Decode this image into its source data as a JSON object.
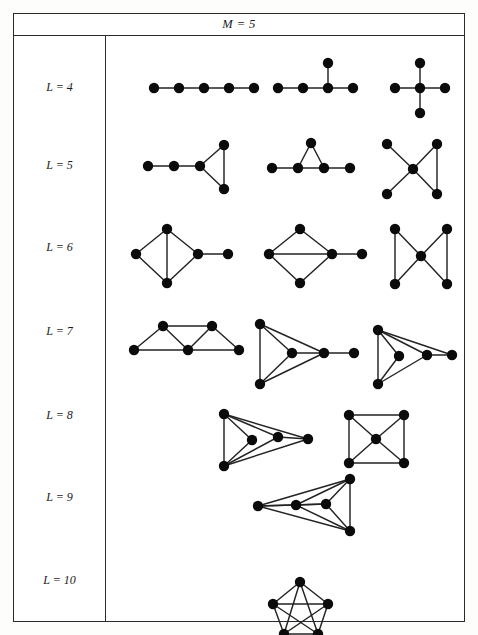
{
  "figure": {
    "header": {
      "title": "M = 5"
    },
    "colors": {
      "border": "#2b2b2b",
      "node": "#0b0b0b",
      "edge": "#232323",
      "background": "#ffffff"
    },
    "rows": [
      {
        "label": "L = 4",
        "edge_count": 4,
        "label_y": 52
      },
      {
        "label": "L = 5",
        "edge_count": 5,
        "label_y": 130
      },
      {
        "label": "L = 6",
        "edge_count": 6,
        "label_y": 212
      },
      {
        "label": "L = 7",
        "edge_count": 7,
        "label_y": 296
      },
      {
        "label": "L = 8",
        "edge_count": 8,
        "label_y": 380
      },
      {
        "label": "L = 9",
        "edge_count": 9,
        "label_y": 462
      },
      {
        "label": "L = 10",
        "edge_count": 10,
        "label_y": 545
      }
    ]
  },
  "chart_data": {
    "type": "diagram",
    "title": "M = 5",
    "node_count": 5,
    "node_radius": 5.2,
    "rows": [
      {
        "label": "L = 4",
        "edge_count": 4,
        "graphs": [
          {
            "name": "path-p5",
            "nodes": [
              [
                48,
                52
              ],
              [
                73,
                52
              ],
              [
                98,
                52
              ],
              [
                123,
                52
              ],
              [
                148,
                52
              ]
            ],
            "edges": [
              [
                0,
                1
              ],
              [
                1,
                2
              ],
              [
                2,
                3
              ],
              [
                3,
                4
              ]
            ]
          },
          {
            "name": "t-shape-tree",
            "nodes": [
              [
                172,
                52
              ],
              [
                197,
                52
              ],
              [
                222,
                52
              ],
              [
                247,
                52
              ],
              [
                222,
                27
              ]
            ],
            "edges": [
              [
                0,
                1
              ],
              [
                1,
                2
              ],
              [
                2,
                3
              ],
              [
                2,
                4
              ]
            ]
          },
          {
            "name": "star-k14",
            "nodes": [
              [
                289,
                52
              ],
              [
                314,
                52
              ],
              [
                339,
                52
              ],
              [
                314,
                27
              ],
              [
                314,
                77
              ]
            ],
            "edges": [
              [
                0,
                1
              ],
              [
                1,
                2
              ],
              [
                1,
                3
              ],
              [
                1,
                4
              ]
            ]
          }
        ]
      },
      {
        "label": "L = 5",
        "edge_count": 5,
        "graphs": [
          {
            "name": "triangle-with-two-tail",
            "nodes": [
              [
                42,
                130
              ],
              [
                68,
                130
              ],
              [
                94,
                130
              ],
              [
                118,
                109
              ],
              [
                118,
                153
              ]
            ],
            "edges": [
              [
                0,
                1
              ],
              [
                1,
                2
              ],
              [
                2,
                3
              ],
              [
                2,
                4
              ],
              [
                3,
                4
              ]
            ]
          },
          {
            "name": "triangle-on-path",
            "nodes": [
              [
                166,
                132
              ],
              [
                192,
                132
              ],
              [
                218,
                132
              ],
              [
                244,
                132
              ],
              [
                205,
                107
              ]
            ],
            "edges": [
              [
                0,
                1
              ],
              [
                1,
                2
              ],
              [
                2,
                3
              ],
              [
                1,
                4
              ],
              [
                2,
                4
              ]
            ]
          },
          {
            "name": "cross-with-triangle",
            "nodes": [
              [
                281,
                108
              ],
              [
                281,
                158
              ],
              [
                307,
                133
              ],
              [
                331,
                108
              ],
              [
                331,
                158
              ]
            ],
            "edges": [
              [
                0,
                2
              ],
              [
                1,
                2
              ],
              [
                2,
                3
              ],
              [
                2,
                4
              ],
              [
                3,
                4
              ]
            ]
          }
        ]
      },
      {
        "label": "L = 6",
        "edge_count": 6,
        "graphs": [
          {
            "name": "diamond-with-pendant",
            "nodes": [
              [
                30,
                218
              ],
              [
                61,
                193
              ],
              [
                61,
                247
              ],
              [
                92,
                218
              ],
              [
                122,
                218
              ]
            ],
            "edges": [
              [
                0,
                1
              ],
              [
                0,
                2
              ],
              [
                1,
                2
              ],
              [
                1,
                3
              ],
              [
                2,
                3
              ],
              [
                3,
                4
              ]
            ]
          },
          {
            "name": "diamond-horizontal-diagonal-pendant",
            "nodes": [
              [
                163,
                218
              ],
              [
                194,
                193
              ],
              [
                194,
                247
              ],
              [
                226,
                218
              ],
              [
                256,
                218
              ]
            ],
            "edges": [
              [
                0,
                1
              ],
              [
                0,
                2
              ],
              [
                0,
                3
              ],
              [
                1,
                3
              ],
              [
                2,
                3
              ],
              [
                3,
                4
              ]
            ]
          },
          {
            "name": "bowtie",
            "nodes": [
              [
                289,
                193
              ],
              [
                289,
                248
              ],
              [
                315,
                220
              ],
              [
                341,
                193
              ],
              [
                341,
                248
              ]
            ],
            "edges": [
              [
                0,
                1
              ],
              [
                0,
                2
              ],
              [
                1,
                2
              ],
              [
                2,
                3
              ],
              [
                2,
                4
              ],
              [
                3,
                4
              ]
            ]
          }
        ]
      },
      {
        "label": "L = 7",
        "edge_count": 7,
        "graphs": [
          {
            "name": "triangular-strip",
            "nodes": [
              [
                28,
                314
              ],
              [
                57,
                290
              ],
              [
                106,
                290
              ],
              [
                82,
                314
              ],
              [
                133,
                314
              ]
            ],
            "edges": [
              [
                0,
                1
              ],
              [
                0,
                3
              ],
              [
                1,
                3
              ],
              [
                1,
                2
              ],
              [
                2,
                3
              ],
              [
                2,
                4
              ],
              [
                3,
                4
              ]
            ]
          },
          {
            "name": "triangle-with-inner-hub-pendant",
            "nodes": [
              [
                154,
                288
              ],
              [
                154,
                348
              ],
              [
                186,
                317
              ],
              [
                218,
                317
              ],
              [
                248,
                317
              ]
            ],
            "edges": [
              [
                0,
                1
              ],
              [
                0,
                2
              ],
              [
                0,
                3
              ],
              [
                1,
                2
              ],
              [
                1,
                3
              ],
              [
                2,
                3
              ],
              [
                3,
                4
              ]
            ]
          },
          {
            "name": "fan-with-outer-node",
            "nodes": [
              [
                272,
                294
              ],
              [
                272,
                348
              ],
              [
                293,
                320
              ],
              [
                321,
                319
              ],
              [
                346,
                319
              ]
            ],
            "edges": [
              [
                0,
                1
              ],
              [
                0,
                2
              ],
              [
                0,
                3
              ],
              [
                0,
                4
              ],
              [
                1,
                2
              ],
              [
                1,
                3
              ],
              [
                3,
                4
              ]
            ]
          }
        ]
      },
      {
        "label": "L = 8",
        "edge_count": 8,
        "graphs": [
          {
            "name": "near-complete-kite",
            "nodes": [
              [
                118,
                378
              ],
              [
                146,
                404
              ],
              [
                118,
                430
              ],
              [
                172,
                401
              ],
              [
                202,
                403
              ]
            ],
            "edges": [
              [
                0,
                1
              ],
              [
                0,
                2
              ],
              [
                0,
                3
              ],
              [
                0,
                4
              ],
              [
                1,
                2
              ],
              [
                2,
                3
              ],
              [
                2,
                4
              ],
              [
                3,
                4
              ]
            ]
          },
          {
            "name": "square-with-center-hub",
            "nodes": [
              [
                243,
                379
              ],
              [
                298,
                379
              ],
              [
                243,
                427
              ],
              [
                298,
                427
              ],
              [
                270,
                403
              ]
            ],
            "edges": [
              [
                0,
                1
              ],
              [
                0,
                2
              ],
              [
                1,
                3
              ],
              [
                2,
                3
              ],
              [
                0,
                4
              ],
              [
                1,
                4
              ],
              [
                2,
                4
              ],
              [
                3,
                4
              ]
            ]
          }
        ]
      },
      {
        "label": "L = 9",
        "edge_count": 9,
        "graphs": [
          {
            "name": "k5-minus-one-edge",
            "nodes": [
              [
                152,
                470
              ],
              [
                190,
                469
              ],
              [
                220,
                468
              ],
              [
                244,
                443
              ],
              [
                244,
                495
              ]
            ],
            "edges": [
              [
                0,
                1
              ],
              [
                0,
                2
              ],
              [
                0,
                3
              ],
              [
                0,
                4
              ],
              [
                1,
                2
              ],
              [
                1,
                3
              ],
              [
                1,
                4
              ],
              [
                2,
                3
              ],
              [
                2,
                4
              ],
              [
                3,
                4
              ]
            ]
          }
        ]
      },
      {
        "label": "L = 10",
        "edge_count": 10,
        "graphs": [
          {
            "name": "k5-complete",
            "nodes": [
              [
                194,
                546
              ],
              [
                167,
                568
              ],
              [
                178,
                598
              ],
              [
                212,
                598
              ],
              [
                222,
                568
              ]
            ],
            "edges": [
              [
                0,
                1
              ],
              [
                0,
                2
              ],
              [
                0,
                3
              ],
              [
                0,
                4
              ],
              [
                1,
                2
              ],
              [
                1,
                3
              ],
              [
                1,
                4
              ],
              [
                2,
                3
              ],
              [
                2,
                4
              ],
              [
                3,
                4
              ]
            ]
          }
        ]
      }
    ]
  }
}
